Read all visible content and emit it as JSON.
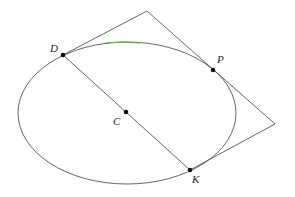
{
  "diagram": {
    "type": "geometry",
    "colors": {
      "stroke": "#555555",
      "point": "#111111",
      "accent_arc": "#5fae3a",
      "background": "#ffffff"
    },
    "ellipse": {
      "cx": 127,
      "cy": 113,
      "rx": 109,
      "ry": 71
    },
    "points": [
      {
        "id": "D",
        "label": "D",
        "x": 63,
        "y": 55,
        "label_x": 50,
        "label_y": 52
      },
      {
        "id": "P",
        "label": "P",
        "x": 213,
        "y": 70,
        "label_x": 217,
        "label_y": 63
      },
      {
        "id": "C",
        "label": "C",
        "x": 126,
        "y": 112,
        "label_x": 113,
        "label_y": 125
      },
      {
        "id": "K",
        "label": "K",
        "x": 190,
        "y": 170,
        "label_x": 192,
        "label_y": 183
      }
    ],
    "lines": [
      {
        "name": "diameter-DK",
        "from": "D",
        "to": "K"
      }
    ],
    "tangent_polygon": {
      "vertices": [
        [
          63,
          55
        ],
        [
          147,
          11
        ],
        [
          275,
          124
        ],
        [
          190,
          170
        ]
      ]
    }
  }
}
